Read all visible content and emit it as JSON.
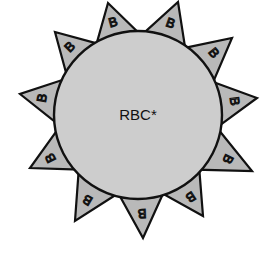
{
  "diagram": {
    "cell": {
      "label": "RBC*",
      "center": [
        138,
        115
      ],
      "radius": 84,
      "fill": "#cdcdcd",
      "stroke": "#111111"
    },
    "antigen": {
      "label": "B",
      "fill": "#b9b9b9",
      "count": 11,
      "tips": [
        [
          108,
          3
        ],
        [
          178,
          2
        ],
        [
          232,
          38
        ],
        [
          257,
          98
        ],
        [
          252,
          171
        ],
        [
          203,
          216
        ],
        [
          143,
          238
        ],
        [
          75,
          221
        ],
        [
          30,
          168
        ],
        [
          20,
          94
        ],
        [
          55,
          32
        ]
      ]
    }
  }
}
